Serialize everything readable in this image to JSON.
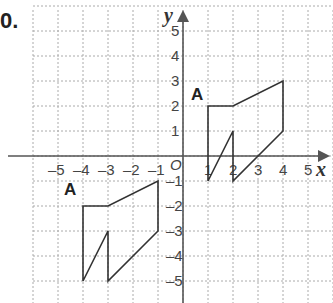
{
  "question_number": "0.",
  "axes": {
    "x_label": "x",
    "y_label": "y",
    "origin_label": "O",
    "x_ticks": [
      "-5",
      "-4",
      "-3",
      "-2",
      "-1",
      "1",
      "2",
      "3",
      "4",
      "5"
    ],
    "y_ticks": [
      "5",
      "4",
      "3",
      "2",
      "1",
      "-1",
      "-2",
      "-3",
      "-4",
      "-5"
    ],
    "range": [
      -6,
      6
    ]
  },
  "shapes": [
    {
      "label": "A",
      "points": [
        [
          1,
          2
        ],
        [
          2,
          2
        ],
        [
          4,
          3
        ],
        [
          4,
          1
        ],
        [
          2,
          -1
        ],
        [
          2,
          1
        ],
        [
          1,
          -1
        ]
      ]
    },
    {
      "label": "A",
      "points": [
        [
          -4,
          -2
        ],
        [
          -3,
          -2
        ],
        [
          -1,
          -1
        ],
        [
          -1,
          -3
        ],
        [
          -3,
          -5
        ],
        [
          -3,
          -3
        ],
        [
          -4,
          -5
        ]
      ]
    }
  ]
}
